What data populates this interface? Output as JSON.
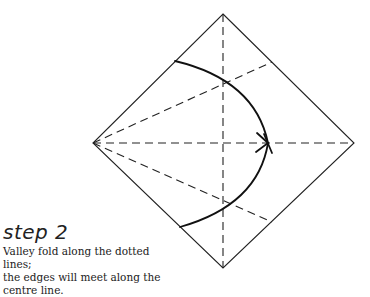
{
  "step": {
    "title": "step 2",
    "instruction_line1": "Valley fold along the dotted lines;",
    "instruction_line2": "the edges will meet along the",
    "instruction_line3": "centre line."
  },
  "diagram": {
    "shape": "square-diamond",
    "stroke_color": "#222222",
    "fold_type": "valley-fold",
    "vertices": {
      "top": [
        223,
        14
      ],
      "left": [
        93,
        143
      ],
      "right": [
        354,
        143
      ],
      "bottom": [
        223,
        268
      ]
    }
  }
}
